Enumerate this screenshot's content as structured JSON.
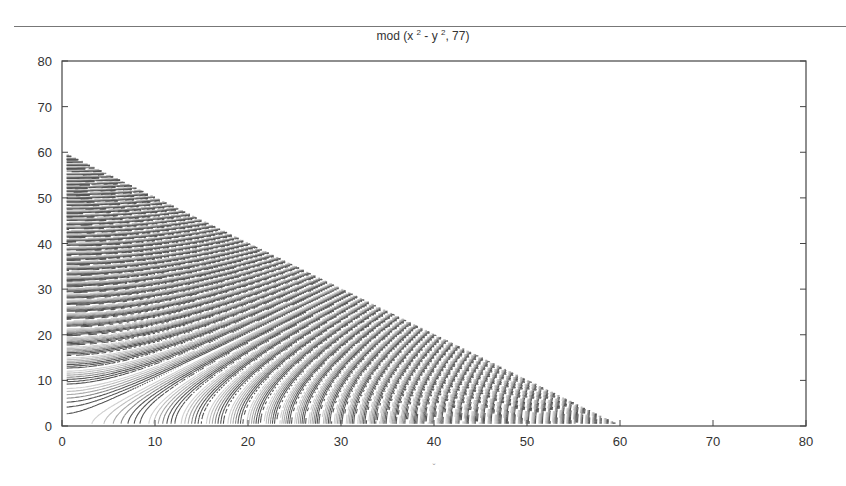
{
  "chart_data": {
    "type": "contour",
    "title_parts": {
      "prefix": "mod (x ",
      "sup1": "2",
      "mid": " - y ",
      "sup2": "2",
      "suffix": ", 77)"
    },
    "function": "mod(x^2 - y^2, 77)",
    "modulus": 77,
    "xlabel": "x",
    "ylabel": "",
    "xlim": [
      0,
      80
    ],
    "ylim": [
      0,
      80
    ],
    "xticks": [
      0,
      10,
      20,
      30,
      40,
      50,
      60,
      70,
      80
    ],
    "yticks": [
      0,
      10,
      20,
      30,
      40,
      50,
      60,
      70,
      80
    ],
    "grid": false,
    "legend": null,
    "saddle_centers": [
      {
        "x": 31,
        "y": 62
      },
      {
        "x": 62,
        "y": 62
      },
      {
        "x": 31,
        "y": 31
      },
      {
        "x": 62,
        "y": 31
      },
      {
        "x": 0,
        "y": 62
      },
      {
        "x": 0,
        "y": 31
      },
      {
        "x": 31,
        "y": 0
      },
      {
        "x": 62,
        "y": 0
      },
      {
        "x": 0,
        "y": 0
      }
    ],
    "contour_colors": [
      "#cfcfcf",
      "#bdbdbd",
      "#a8a8a8",
      "#8a8a8a",
      "#555555"
    ]
  },
  "axes": {
    "x_tick_labels": [
      "0",
      "10",
      "20",
      "30",
      "40",
      "50",
      "60",
      "70",
      "80"
    ],
    "y_tick_labels": [
      "0",
      "10",
      "20",
      "30",
      "40",
      "50",
      "60",
      "70",
      "80"
    ],
    "x_axis_label": "x"
  }
}
